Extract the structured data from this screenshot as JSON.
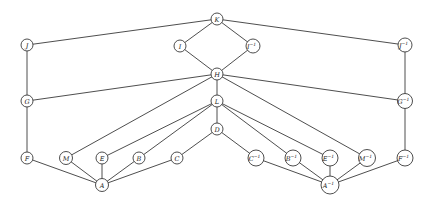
{
  "diagram": {
    "type": "graph",
    "colors": {
      "stroke": "#3a3a3a",
      "fill": "#ffffff",
      "text": "#222222"
    },
    "nodes": [
      {
        "id": "K",
        "label": "K",
        "sup": "",
        "x": 217,
        "y": 19,
        "r": 6
      },
      {
        "id": "I",
        "label": "I",
        "sup": "",
        "x": 180,
        "y": 46,
        "r": 6
      },
      {
        "id": "Ii",
        "label": "I",
        "sup": "−1",
        "x": 253,
        "y": 46,
        "r": 7
      },
      {
        "id": "J",
        "label": "J",
        "sup": "",
        "x": 27,
        "y": 45,
        "r": 6
      },
      {
        "id": "Ji",
        "label": "J",
        "sup": "−1",
        "x": 405,
        "y": 45,
        "r": 7
      },
      {
        "id": "H",
        "label": "H",
        "sup": "",
        "x": 217,
        "y": 74,
        "r": 6
      },
      {
        "id": "G",
        "label": "G",
        "sup": "",
        "x": 27,
        "y": 101,
        "r": 6
      },
      {
        "id": "Gi",
        "label": "G",
        "sup": "−1",
        "x": 405,
        "y": 101,
        "r": 7.5
      },
      {
        "id": "L",
        "label": "L",
        "sup": "",
        "x": 217,
        "y": 101,
        "r": 6
      },
      {
        "id": "D",
        "label": "D",
        "sup": "",
        "x": 217,
        "y": 129,
        "r": 6
      },
      {
        "id": "F",
        "label": "F",
        "sup": "",
        "x": 27,
        "y": 158,
        "r": 6
      },
      {
        "id": "M",
        "label": "M",
        "sup": "",
        "x": 66,
        "y": 158,
        "r": 6.5
      },
      {
        "id": "E",
        "label": "E",
        "sup": "",
        "x": 102,
        "y": 158,
        "r": 6
      },
      {
        "id": "B",
        "label": "B",
        "sup": "",
        "x": 139,
        "y": 158,
        "r": 6
      },
      {
        "id": "C",
        "label": "C",
        "sup": "",
        "x": 177,
        "y": 158,
        "r": 6
      },
      {
        "id": "Ci",
        "label": "C",
        "sup": "−1",
        "x": 256,
        "y": 158,
        "r": 8
      },
      {
        "id": "Bi",
        "label": "B",
        "sup": "−1",
        "x": 293,
        "y": 158,
        "r": 8
      },
      {
        "id": "Ei",
        "label": "E",
        "sup": "−1",
        "x": 330,
        "y": 158,
        "r": 8
      },
      {
        "id": "Mi",
        "label": "M",
        "sup": "−1",
        "x": 367,
        "y": 158,
        "r": 8.5
      },
      {
        "id": "Fi",
        "label": "F",
        "sup": "−1",
        "x": 405,
        "y": 158,
        "r": 8
      },
      {
        "id": "A",
        "label": "A",
        "sup": "",
        "x": 102,
        "y": 185,
        "r": 6.5
      },
      {
        "id": "Ai",
        "label": "A",
        "sup": "−1",
        "x": 330,
        "y": 185,
        "r": 9
      }
    ],
    "edges": [
      [
        "K",
        "J"
      ],
      [
        "K",
        "I"
      ],
      [
        "K",
        "Ii"
      ],
      [
        "K",
        "Ji"
      ],
      [
        "I",
        "H"
      ],
      [
        "Ii",
        "H"
      ],
      [
        "J",
        "G"
      ],
      [
        "Ji",
        "Gi"
      ],
      [
        "H",
        "G"
      ],
      [
        "H",
        "Gi"
      ],
      [
        "H",
        "L"
      ],
      [
        "H",
        "M"
      ],
      [
        "H",
        "Mi"
      ],
      [
        "G",
        "F"
      ],
      [
        "Gi",
        "Fi"
      ],
      [
        "L",
        "E"
      ],
      [
        "L",
        "B"
      ],
      [
        "L",
        "D"
      ],
      [
        "L",
        "Bi"
      ],
      [
        "L",
        "Ei"
      ],
      [
        "D",
        "C"
      ],
      [
        "D",
        "Ci"
      ],
      [
        "A",
        "F"
      ],
      [
        "A",
        "M"
      ],
      [
        "A",
        "E"
      ],
      [
        "A",
        "B"
      ],
      [
        "A",
        "C"
      ],
      [
        "Ai",
        "Ci"
      ],
      [
        "Ai",
        "Bi"
      ],
      [
        "Ai",
        "Ei"
      ],
      [
        "Ai",
        "Mi"
      ],
      [
        "Ai",
        "Fi"
      ]
    ]
  }
}
